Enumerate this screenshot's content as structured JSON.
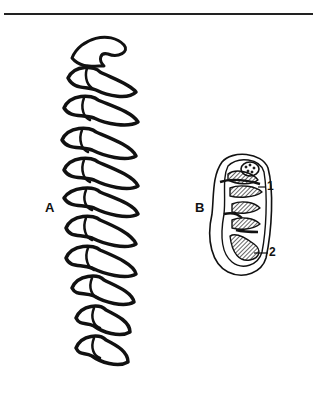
{
  "figure": {
    "type": "scientific illustration",
    "panels": [
      {
        "id": "A",
        "label": "A",
        "description": "elongated series of folded enamel loops (left)"
      },
      {
        "id": "B",
        "label": "B",
        "description": "oval tooth crown with hatched dentine fields (right)",
        "callouts": [
          {
            "label": "1"
          },
          {
            "label": "2"
          }
        ]
      }
    ]
  },
  "colors": {
    "ink": "#111111",
    "background": "#ffffff"
  }
}
